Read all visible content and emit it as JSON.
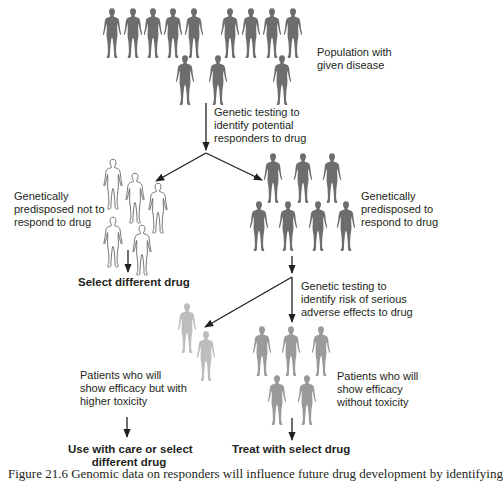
{
  "diagram": {
    "colors": {
      "population": "#6d6d6d",
      "responders": "#6d6d6d",
      "non_responders_fill": "#ffffff",
      "non_responders_stroke": "#555555",
      "higher_toxicity": "#bdbdbd",
      "no_toxicity": "#9a9a9a",
      "arrow": "#231f20"
    },
    "nodes": {
      "population": {
        "label_line1": "Population with",
        "label_line2": "given disease",
        "count": 12
      },
      "test1": {
        "line1": "Genetic testing to",
        "line2": "identify potential",
        "line3": "responders to drug"
      },
      "non_responders": {
        "line1": "Genetically",
        "line2": "predisposed not to",
        "line3": "respond to drug",
        "count": 5,
        "outcome": "Select different drug"
      },
      "responders": {
        "line1": "Genetically",
        "line2": "predisposed to",
        "line3": "respond to drug",
        "count": 7
      },
      "test2": {
        "line1": "Genetic testing to",
        "line2": "identify risk of serious",
        "line3": "adverse effects to drug"
      },
      "toxic": {
        "line1": "Patients who will",
        "line2": "show efficacy but with",
        "line3": "higher toxicity",
        "count": 2,
        "outcome_line1": "Use with care or select",
        "outcome_line2": "different drug"
      },
      "nontoxic": {
        "line1": "Patients who will",
        "line2": "show efficacy",
        "line3": "without toxicity",
        "count": 5,
        "outcome": "Treat with select drug"
      }
    },
    "caption_partial": "Figure 21.6  Genomic data on responders will influence future drug development by identifying"
  }
}
